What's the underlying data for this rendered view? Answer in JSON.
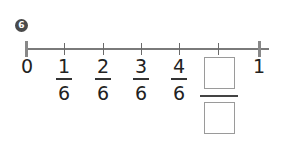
{
  "problem": {
    "number": "6"
  },
  "number_line": {
    "start_label": "0",
    "end_label": "1",
    "fractions": [
      {
        "numerator": "1",
        "denominator": "6"
      },
      {
        "numerator": "2",
        "denominator": "6"
      },
      {
        "numerator": "3",
        "denominator": "6"
      },
      {
        "numerator": "4",
        "denominator": "6"
      }
    ],
    "answer": {
      "numerator": "",
      "denominator": ""
    }
  },
  "colors": {
    "axis": "#7a7a7a",
    "badge": "#4a4a4a",
    "box_border": "#9a9a9a"
  }
}
